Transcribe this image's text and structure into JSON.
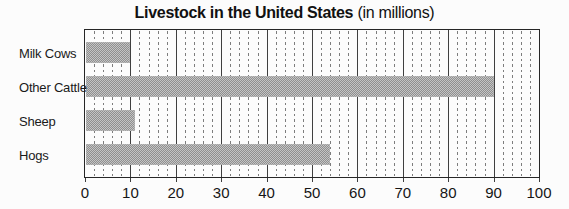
{
  "title": {
    "main": "Livestock in the United States",
    "suffix": " (in millions)"
  },
  "chart_data": {
    "type": "bar",
    "orientation": "horizontal",
    "title": "Livestock in the United States (in millions)",
    "categories": [
      "Milk Cows",
      "Other Cattle",
      "Sheep",
      "Hogs"
    ],
    "values": [
      10,
      90,
      11,
      54
    ],
    "xlabel": "",
    "ylabel": "",
    "xlim": [
      0,
      100
    ],
    "xticks": [
      0,
      10,
      20,
      30,
      40,
      50,
      60,
      70,
      80,
      90,
      100
    ],
    "grid": {
      "major_every": 10,
      "major_style": "solid",
      "minor_every": 2,
      "minor_style": "dashed"
    },
    "legend": "none",
    "colors": {
      "bar_dark": "#8f8f8f",
      "bar_light": "#c4c4c4",
      "grid_major": "#3f3f3f",
      "grid_minor": "#7d7d7d",
      "frame": "#262626",
      "text": "#1a1a1a",
      "background": "#fcfcfc"
    }
  }
}
